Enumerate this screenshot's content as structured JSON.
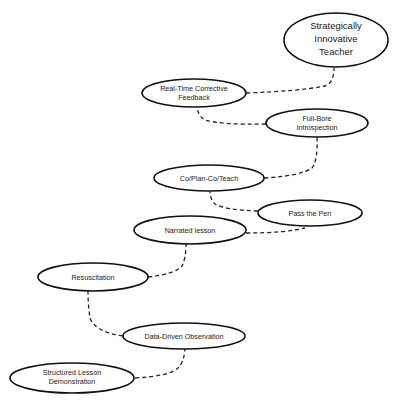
{
  "diagram": {
    "type": "staircase-flow",
    "nodes": [
      {
        "id": "sit",
        "lines": [
          "Strategically",
          "Innovative",
          "Teacher"
        ]
      },
      {
        "id": "rtcf",
        "lines": [
          "Real-Time Corrective",
          "Feedback"
        ]
      },
      {
        "id": "fbi",
        "lines": [
          "Full-Bore",
          "Introspection"
        ]
      },
      {
        "id": "cpct",
        "lines": [
          "Co/Plan-Co/Teach"
        ]
      },
      {
        "id": "ptp",
        "lines": [
          "Pass the Pen"
        ]
      },
      {
        "id": "nl",
        "lines": [
          "Narrated lesson"
        ]
      },
      {
        "id": "res",
        "lines": [
          "Resuscitation"
        ]
      },
      {
        "id": "ddo",
        "lines": [
          "Data-Driven Observation"
        ]
      },
      {
        "id": "sld",
        "lines": [
          "Structured Lesson",
          "Demonstration"
        ]
      }
    ],
    "edges": [
      [
        "sld",
        "ddo"
      ],
      [
        "ddo",
        "res"
      ],
      [
        "res",
        "nl"
      ],
      [
        "nl",
        "ptp"
      ],
      [
        "ptp",
        "cpct"
      ],
      [
        "cpct",
        "fbi"
      ],
      [
        "fbi",
        "rtcf"
      ],
      [
        "rtcf",
        "sit"
      ]
    ],
    "edge_style": "dashed"
  }
}
